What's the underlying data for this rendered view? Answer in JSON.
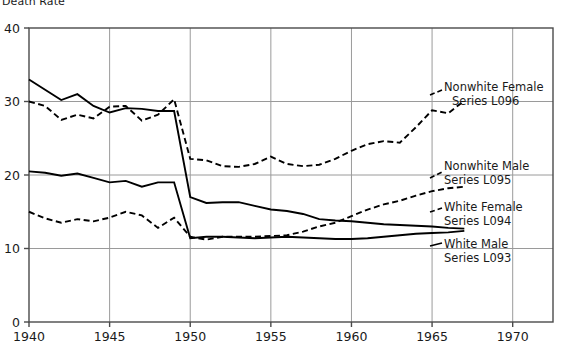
{
  "chart_data": {
    "type": "line",
    "title": "Death Rate",
    "xlabel": "",
    "ylabel": "Death Rate",
    "xlim": [
      1940,
      1972.5
    ],
    "ylim": [
      0,
      40
    ],
    "xticks": [
      1940,
      1945,
      1950,
      1955,
      1960,
      1965,
      1970
    ],
    "yticks": [
      0,
      10,
      20,
      30,
      40
    ],
    "grid": true,
    "legend_position": "right-inline",
    "series": [
      {
        "name": "Nonwhite Male",
        "code": "Series L093",
        "label_line1": "Nonwhite Male",
        "label_line2": "Series L093",
        "style": "solid",
        "color": "#000000",
        "x": [
          1940,
          1941,
          1942,
          1943,
          1944,
          1945,
          1946,
          1947,
          1948,
          1949,
          1950,
          1951,
          1952,
          1953,
          1954,
          1955,
          1956,
          1957,
          1958,
          1959,
          1960,
          1961,
          1962,
          1963,
          1964,
          1965,
          1966,
          1967
        ],
        "values": [
          33.0,
          31.6,
          30.2,
          31.0,
          29.4,
          28.5,
          29.1,
          29.0,
          28.7,
          28.7,
          17.0,
          16.2,
          16.3,
          16.3,
          15.8,
          15.3,
          15.1,
          14.7,
          14.0,
          13.8,
          13.7,
          13.5,
          13.3,
          13.2,
          13.1,
          13.0,
          12.8,
          12.7
        ]
      },
      {
        "name": "Nonwhite Female",
        "code": "Series L096",
        "label_line1": "Nonwhite Female",
        "label_line2": "Series L096",
        "style": "dashed",
        "color": "#000000",
        "x": [
          1940,
          1941,
          1942,
          1943,
          1944,
          1945,
          1946,
          1947,
          1948,
          1949,
          1950,
          1951,
          1952,
          1953,
          1954,
          1955,
          1956,
          1957,
          1958,
          1959,
          1960,
          1961,
          1962,
          1963,
          1964,
          1965,
          1966,
          1967
        ],
        "values": [
          30.0,
          29.4,
          27.5,
          28.2,
          27.7,
          29.3,
          29.4,
          27.4,
          28.2,
          30.3,
          22.2,
          22.0,
          21.2,
          21.1,
          21.5,
          22.5,
          21.5,
          21.2,
          21.4,
          22.2,
          23.3,
          24.2,
          24.6,
          24.4,
          26.5,
          28.8,
          28.4,
          30.1
        ]
      },
      {
        "name": "White Male",
        "code": "Series L093",
        "label_line1": "White Male",
        "label_line2": "Series L093",
        "style": "solid",
        "color": "#000000",
        "x": [
          1940,
          1941,
          1942,
          1943,
          1944,
          1945,
          1946,
          1947,
          1948,
          1949,
          1950,
          1951,
          1952,
          1953,
          1954,
          1955,
          1956,
          1957,
          1958,
          1959,
          1960,
          1961,
          1962,
          1963,
          1964,
          1965,
          1966,
          1967
        ],
        "values": [
          20.5,
          20.3,
          19.9,
          20.2,
          19.6,
          19.0,
          19.2,
          18.4,
          19.0,
          19.0,
          11.4,
          11.6,
          11.6,
          11.5,
          11.4,
          11.5,
          11.6,
          11.5,
          11.4,
          11.3,
          11.3,
          11.4,
          11.6,
          11.8,
          12.0,
          12.1,
          12.2,
          12.4
        ]
      },
      {
        "name": "White Female",
        "code": "Series L094",
        "label_line1": "White Female",
        "label_line2": "Series L094",
        "style": "dashed",
        "color": "#000000",
        "x": [
          1940,
          1941,
          1942,
          1943,
          1944,
          1945,
          1946,
          1947,
          1948,
          1949,
          1950,
          1951,
          1952,
          1953,
          1954,
          1955,
          1956,
          1957,
          1958,
          1959,
          1960,
          1961,
          1962,
          1963,
          1964,
          1965,
          1966,
          1967
        ],
        "values": [
          15.0,
          14.1,
          13.5,
          14.0,
          13.7,
          14.2,
          15.0,
          14.5,
          12.8,
          14.2,
          11.6,
          11.2,
          11.6,
          11.6,
          11.6,
          11.7,
          11.8,
          12.3,
          13.0,
          13.5,
          14.4,
          15.3,
          16.0,
          16.5,
          17.2,
          17.8,
          18.2,
          18.4
        ]
      }
    ]
  },
  "axis": {
    "title": "Death Rate",
    "yticks": [
      "0",
      "10",
      "20",
      "30",
      "40"
    ],
    "xticks": [
      "1940",
      "1945",
      "1950",
      "1955",
      "1960",
      "1965",
      "1970"
    ]
  },
  "labels": {
    "nonwhite_female_1": "Nonwhite Female",
    "nonwhite_female_2": "Series L096",
    "nonwhite_male_1": "Nonwhite Male",
    "nonwhite_male_2": "Series L095",
    "white_female_1": "White Female",
    "white_female_2": "Series L094",
    "white_male_1": "White Male",
    "white_male_2": "Series L093"
  },
  "colors": {
    "line": "#000000",
    "grid": "#9a9a9a",
    "frame": "#4a4a4a",
    "text": "#1a1a1a"
  }
}
